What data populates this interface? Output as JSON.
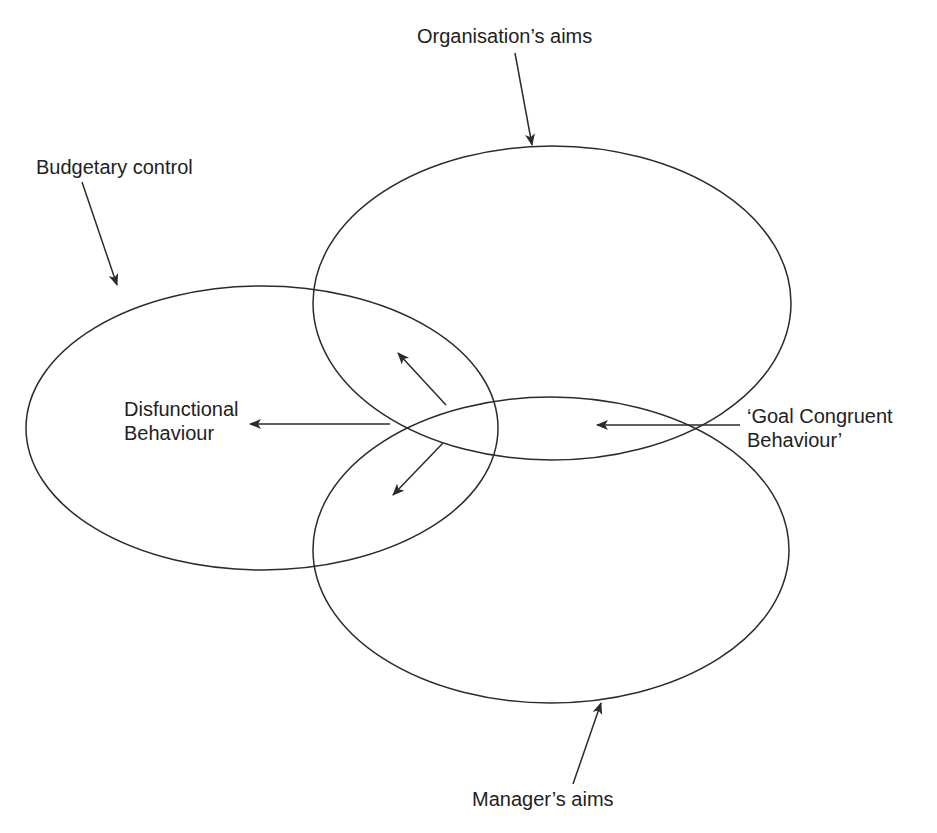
{
  "diagram": {
    "colors": {
      "stroke": "#2b2b2b",
      "text": "#222222",
      "background": "#ffffff"
    },
    "labels": {
      "organisation": "Organisation’s aims",
      "budgetary": "Budgetary control",
      "disfunctional_line1": "Disfunctional",
      "disfunctional_line2": "Behaviour",
      "goal_line1": "‘Goal Congruent",
      "goal_line2": "Behaviour’",
      "manager": "Manager’s aims"
    },
    "ellipses": [
      {
        "name": "organisation-aims",
        "cx": 552,
        "cy": 303,
        "rx": 239,
        "ry": 157
      },
      {
        "name": "budgetary-control",
        "cx": 262,
        "cy": 428,
        "rx": 236,
        "ry": 142
      },
      {
        "name": "manager-aims",
        "cx": 551,
        "cy": 550,
        "rx": 238,
        "ry": 153
      }
    ]
  }
}
